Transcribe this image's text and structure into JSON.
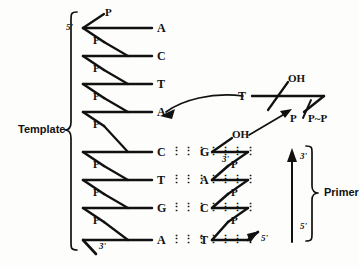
{
  "figure": {
    "template_label": "Template",
    "primer_label": "Primer"
  },
  "template_strand": {
    "five_prime_label": "5'",
    "three_prime_label": "3'",
    "bases": [
      "A",
      "C",
      "T",
      "A",
      "C",
      "T",
      "G",
      "A"
    ],
    "phosphate_label": "P",
    "phosphates": [
      "P",
      "P",
      "P",
      "P",
      "P",
      "P",
      "P",
      "P",
      "P"
    ]
  },
  "primer_strand": {
    "three_prime_label": "3'",
    "five_prime_label": "5'",
    "bases": [
      "G",
      "A",
      "C",
      "T"
    ],
    "phosphates": [
      "P",
      "P",
      "P"
    ],
    "terminal_oh": "OH",
    "direction_arrow": {
      "top_label": "3'",
      "bottom_label": "5'"
    }
  },
  "incoming_nucleotide": {
    "base": "T",
    "hydroxyl": "OH",
    "triphosphate_first": "P",
    "triphosphate_rest": "P~P"
  },
  "base_pairs": [
    {
      "template": "C",
      "primer": "G",
      "bonds": 3
    },
    {
      "template": "T",
      "primer": "A",
      "bonds": 2
    },
    {
      "template": "G",
      "primer": "C",
      "bonds": 3
    },
    {
      "template": "A",
      "primer": "T",
      "bonds": 2
    }
  ],
  "colors": {
    "ink": "#111111",
    "background": "#fdfdfc"
  }
}
